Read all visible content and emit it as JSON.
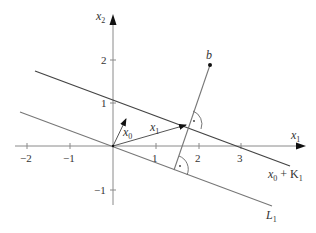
{
  "axes": {
    "x_label": "x",
    "x_sub": "1",
    "y_label": "x",
    "y_sub": "2",
    "x_ticks": [
      "−2",
      "−1",
      "1",
      "2",
      "3"
    ],
    "y_ticks": [
      "2",
      "1",
      "−1"
    ]
  },
  "vectors": {
    "x0": {
      "label": "x",
      "sub": "0"
    },
    "x1": {
      "label": "x",
      "sub": "1"
    }
  },
  "point_b": {
    "label": "b"
  },
  "lines": {
    "affine": {
      "label_a": "x",
      "label_a_sub": "0",
      "label_plus": " + K",
      "label_plus_sub": "1"
    },
    "subspace": {
      "label": "L",
      "label_sub": "1"
    }
  },
  "right_angle_marker": "·"
}
